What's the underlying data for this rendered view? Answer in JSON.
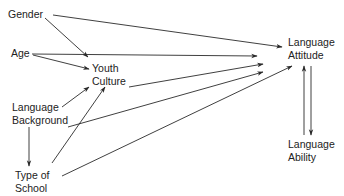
{
  "diagram": {
    "type": "path-diagram",
    "nodes": {
      "gender": {
        "line1": "Gender"
      },
      "age": {
        "line1": "Age"
      },
      "youth_culture": {
        "line1": "Youth",
        "line2": "Culture"
      },
      "language_background": {
        "line1": "Language",
        "line2": "Background"
      },
      "type_of_school": {
        "line1": "Type of",
        "line2": "School"
      },
      "language_attitude": {
        "line1": "Language",
        "line2": "Attitude"
      },
      "language_ability": {
        "line1": "Language",
        "line2": "Ability"
      }
    },
    "edges": [
      {
        "from": "Gender",
        "to": "Language Attitude"
      },
      {
        "from": "Gender",
        "to": "Youth Culture"
      },
      {
        "from": "Age",
        "to": "Language Attitude"
      },
      {
        "from": "Age",
        "to": "Youth Culture"
      },
      {
        "from": "Youth Culture",
        "to": "Language Attitude"
      },
      {
        "from": "Language Background",
        "to": "Youth Culture"
      },
      {
        "from": "Language Background",
        "to": "Language Attitude"
      },
      {
        "from": "Language Background",
        "to": "Type of School"
      },
      {
        "from": "Type of School",
        "to": "Youth Culture"
      },
      {
        "from": "Type of School",
        "to": "Language Attitude"
      },
      {
        "from": "Language Ability",
        "to": "Language Attitude"
      },
      {
        "from": "Language Attitude",
        "to": "Language Ability"
      }
    ],
    "colors": {
      "line": "#2a2a2a",
      "text": "#222222",
      "background": "#ffffff"
    }
  }
}
